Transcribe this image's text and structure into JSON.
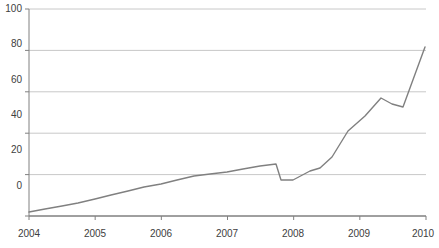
{
  "chart_data": {
    "type": "line",
    "title": "",
    "subtitle": "",
    "xlabel": "",
    "ylabel": "",
    "xlim": [
      2004,
      2010
    ],
    "ylim": [
      0,
      100
    ],
    "grid": true,
    "grid_axis": "y",
    "legend": false,
    "legend_position": "none",
    "line_color": "#808080",
    "grid_color": "#c8c8c8",
    "axis_color": "#808080",
    "tick_label_color": "#404040",
    "background_color": "#ffffff",
    "ytick_labels": [
      "100",
      "80",
      "60",
      "40",
      "20",
      "0"
    ],
    "ytick_values": [
      100,
      80,
      60,
      40,
      20,
      0
    ],
    "xtick_labels": [
      "2004",
      "2005",
      "2006",
      "2007",
      "2008",
      "2009",
      "2010"
    ],
    "xtick_values": [
      2004,
      2005,
      2006,
      2007,
      2008,
      2009,
      2010
    ],
    "series": [
      {
        "name": "series-1",
        "x": [
          2004.0,
          2004.25,
          2004.5,
          2004.75,
          2005.0,
          2005.25,
          2005.5,
          2005.75,
          2006.0,
          2006.25,
          2006.5,
          2006.75,
          2007.0,
          2007.25,
          2007.5,
          2007.75,
          2008.0,
          2008.25,
          2008.5,
          2008.75,
          2009.0,
          2009.25,
          2009.5,
          2009.75,
          2010.0
        ],
        "values": [
          2.0,
          2.5,
          3.2,
          4.0,
          5.0,
          6.0,
          7.0,
          8.0,
          9.0,
          10.5,
          12.0,
          13.0,
          14.0,
          15.5,
          16.5,
          17.0,
          21.5,
          21.5,
          22.0,
          26.0,
          33.0,
          41.0,
          45.0,
          51.0,
          58.0
        ],
        "extra_x": [
          2010.15,
          2010.35,
          2010.6
        ],
        "extra_values": [
          57.0,
          53.5,
          81.7
        ]
      }
    ],
    "points_px": [
      [
        29,
        212
      ],
      [
        45,
        209
      ],
      [
        62,
        206
      ],
      [
        78,
        203
      ],
      [
        95,
        199
      ],
      [
        111,
        195
      ],
      [
        128,
        191
      ],
      [
        144,
        187
      ],
      [
        161,
        184
      ],
      [
        177,
        180
      ],
      [
        194,
        176
      ],
      [
        210,
        174
      ],
      [
        227,
        172
      ],
      [
        243,
        169
      ],
      [
        260,
        166
      ],
      [
        276,
        164
      ],
      [
        281,
        180
      ],
      [
        293,
        180
      ],
      [
        310,
        171
      ],
      [
        320,
        168
      ],
      [
        332,
        157
      ],
      [
        348,
        131
      ],
      [
        365,
        116
      ],
      [
        381,
        98
      ],
      [
        392,
        104
      ],
      [
        403,
        107
      ],
      [
        425,
        47
      ]
    ]
  },
  "meta": {
    "chart_name": "growth-line-chart"
  }
}
